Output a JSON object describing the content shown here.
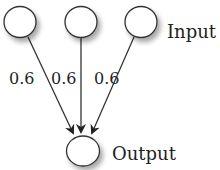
{
  "diagram": {
    "type": "neural-network",
    "input_label": "Input",
    "output_label": "Output",
    "inputs": [
      {
        "id": "input-1",
        "weight": "0.6"
      },
      {
        "id": "input-2",
        "weight": "0.6"
      },
      {
        "id": "input-3",
        "weight": "0.6"
      }
    ],
    "output": {
      "id": "output-1"
    },
    "colors": {
      "stroke": "#333333",
      "fill": "#ffffff",
      "shadow": "#bbbbbb"
    }
  }
}
